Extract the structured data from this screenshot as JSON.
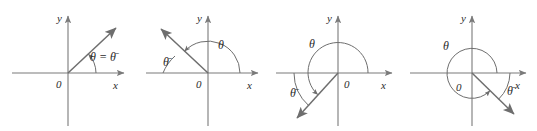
{
  "figure": {
    "name": "reference-angle-quadrant-diagrams",
    "background_color": "#ffffff",
    "axis_color": "#7a7a7a",
    "ray_color": "#6e6e6e",
    "arc_color": "#6e6e6e",
    "label_color": "#2b2b2b",
    "panel_count": 4
  },
  "panels": [
    {
      "id": "panel-1",
      "quadrant": "I",
      "x_axis_label": "x",
      "y_axis_label": "y",
      "origin_label": "0",
      "theta_label": "θ = θ̄",
      "theta_plain": "θ",
      "theta_bar": "θ̄",
      "has_reference_label": false,
      "ray_angle_deg": 43,
      "theta_arc_start_deg": 0,
      "theta_arc_end_deg": 43,
      "reference_arc": null,
      "has_circle": false
    },
    {
      "id": "panel-2",
      "quadrant": "II",
      "x_axis_label": "x",
      "y_axis_label": "y",
      "origin_label": "0",
      "theta_label": "θ",
      "theta_bar_label": "θ̄",
      "has_reference_label": true,
      "ray_angle_deg": 137,
      "theta_arc_start_deg": 0,
      "theta_arc_end_deg": 137,
      "reference_arc_start_deg": 137,
      "reference_arc_end_deg": 180,
      "has_circle": false
    },
    {
      "id": "panel-3",
      "quadrant": "III",
      "x_axis_label": "x",
      "y_axis_label": "y",
      "origin_label": "0",
      "theta_label": "θ",
      "theta_bar_label": "θ̄",
      "has_reference_label": true,
      "ray_angle_deg": 228,
      "theta_arc_start_deg": 0,
      "theta_arc_end_deg": 228,
      "reference_arc_start_deg": 180,
      "reference_arc_end_deg": 228,
      "has_circle": false
    },
    {
      "id": "panel-4",
      "quadrant": "IV",
      "x_axis_label": "x",
      "y_axis_label": "y",
      "origin_label": "0",
      "theta_label": "θ",
      "theta_bar_label": "θ̄",
      "has_reference_label": true,
      "ray_angle_deg": 316,
      "theta_arc_start_deg": 0,
      "theta_arc_end_deg": 316,
      "reference_arc_start_deg": 316,
      "reference_arc_end_deg": 360,
      "has_circle": true
    }
  ]
}
